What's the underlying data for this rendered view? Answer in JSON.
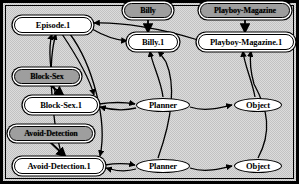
{
  "figure": {
    "background_color": "#d8d8d8",
    "border_color": "#000000",
    "concept_fill": "#9e9e9e",
    "instance_fill": "#ffffff",
    "edge_color": "#000000"
  },
  "nodes": [
    {
      "id": "episode_1",
      "label": "Episode.1",
      "kind": "instance",
      "x": 14,
      "y": 17,
      "w": 78,
      "h": 16
    },
    {
      "id": "billy",
      "label": "Billy",
      "kind": "concept",
      "x": 124,
      "y": 3,
      "w": 48,
      "h": 15
    },
    {
      "id": "playboy_magazine",
      "label": "Playboy-Magazine",
      "kind": "concept",
      "x": 200,
      "y": 3,
      "w": 90,
      "h": 15
    },
    {
      "id": "billy_1",
      "label": "Billy.1",
      "kind": "instance",
      "x": 128,
      "y": 34,
      "w": 50,
      "h": 16
    },
    {
      "id": "playboy_mag_1",
      "label": "Playboy-Magazine.1",
      "kind": "instance",
      "x": 198,
      "y": 34,
      "w": 96,
      "h": 16
    },
    {
      "id": "block_sex",
      "label": "Block-Sex",
      "kind": "concept",
      "x": 14,
      "y": 69,
      "w": 66,
      "h": 15
    },
    {
      "id": "block_sex_1",
      "label": "Block-Sex.1",
      "kind": "instance",
      "x": 24,
      "y": 97,
      "w": 74,
      "h": 16
    },
    {
      "id": "planner_a",
      "label": "Planner",
      "kind": "role",
      "x": 136,
      "y": 98,
      "w": 54,
      "h": 14
    },
    {
      "id": "object_a",
      "label": "Object",
      "kind": "role",
      "x": 234,
      "y": 98,
      "w": 48,
      "h": 14
    },
    {
      "id": "avoid_detection",
      "label": "Avoid-Detection",
      "kind": "concept",
      "x": 9,
      "y": 126,
      "w": 84,
      "h": 15
    },
    {
      "id": "avoid_detect_1",
      "label": "Avoid-Detection.1",
      "kind": "instance",
      "x": 14,
      "y": 158,
      "w": 90,
      "h": 16
    },
    {
      "id": "planner_b",
      "label": "Planner",
      "kind": "role",
      "x": 136,
      "y": 159,
      "w": 54,
      "h": 14
    },
    {
      "id": "object_b",
      "label": "Object",
      "kind": "role",
      "x": 234,
      "y": 159,
      "w": 48,
      "h": 14
    }
  ],
  "edges": [
    {
      "from": "billy",
      "to": "billy_1",
      "kind": "instance-of"
    },
    {
      "from": "playboy_magazine",
      "to": "playboy_mag_1",
      "kind": "instance-of"
    },
    {
      "from": "block_sex",
      "to": "block_sex_1",
      "kind": "instance-of"
    },
    {
      "from": "avoid_detection",
      "to": "avoid_detect_1",
      "kind": "instance-of"
    },
    {
      "from": "episode_1",
      "to": "billy_1",
      "kind": "role-filler"
    },
    {
      "from": "playboy_mag_1",
      "to": "episode_1",
      "kind": "role-filler"
    },
    {
      "from": "episode_1",
      "to": "block_sex_1",
      "kind": "role-filler"
    },
    {
      "from": "episode_1",
      "to": "avoid_detect_1",
      "kind": "role-filler"
    },
    {
      "from": "block_sex_1",
      "to": "episode_1",
      "kind": "role-filler"
    },
    {
      "from": "avoid_detect_1",
      "to": "episode_1",
      "kind": "role-filler"
    },
    {
      "from": "block_sex_1",
      "to": "planner_a",
      "kind": "role"
    },
    {
      "from": "planner_a",
      "to": "block_sex_1",
      "kind": "role"
    },
    {
      "from": "planner_a",
      "to": "object_a",
      "kind": "role"
    },
    {
      "from": "planner_a",
      "to": "billy_1",
      "kind": "filler"
    },
    {
      "from": "object_a",
      "to": "playboy_mag_1",
      "kind": "filler"
    },
    {
      "from": "avoid_detect_1",
      "to": "planner_b",
      "kind": "role"
    },
    {
      "from": "planner_b",
      "to": "avoid_detect_1",
      "kind": "role"
    },
    {
      "from": "planner_b",
      "to": "object_b",
      "kind": "role"
    },
    {
      "from": "planner_b",
      "to": "billy_1",
      "kind": "filler"
    },
    {
      "from": "object_b",
      "to": "playboy_mag_1",
      "kind": "filler"
    }
  ]
}
